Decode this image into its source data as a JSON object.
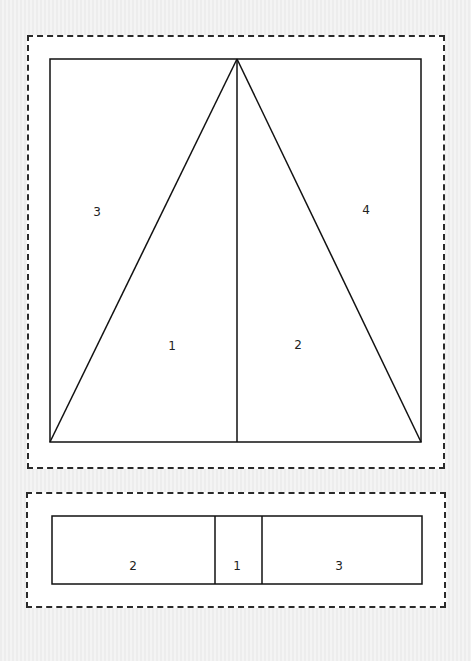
{
  "top_diagram": {
    "frame": {
      "x": 50,
      "y": 59,
      "w": 371,
      "h": 383
    },
    "apex": {
      "x": 237,
      "y": 59
    },
    "divider_x": 237,
    "labels": [
      {
        "text": "3",
        "x": 97,
        "y": 212
      },
      {
        "text": "4",
        "x": 366,
        "y": 210
      },
      {
        "text": "1",
        "x": 172,
        "y": 346
      },
      {
        "text": "2",
        "x": 298,
        "y": 345
      }
    ]
  },
  "bottom_diagram": {
    "frame": {
      "x": 52,
      "y": 516,
      "w": 370,
      "h": 68
    },
    "dividers_x": [
      215,
      262
    ],
    "labels": [
      {
        "text": "2",
        "x": 133,
        "y": 566
      },
      {
        "text": "1",
        "x": 237,
        "y": 566
      },
      {
        "text": "3",
        "x": 339,
        "y": 566
      }
    ]
  },
  "colors": {
    "stroke": "#111111",
    "dash": "#2a2a2a",
    "panel": "#ffffff"
  }
}
